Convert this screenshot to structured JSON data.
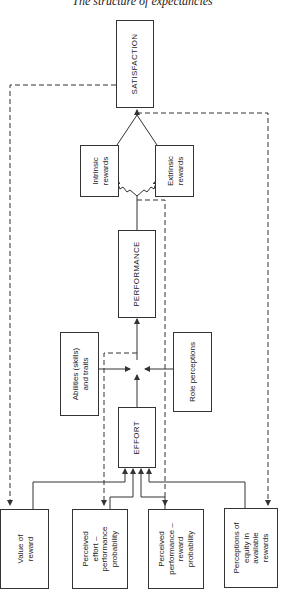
{
  "title": "The structure of expectancies",
  "nodes": {
    "satisfaction": "SATISFACTION",
    "intrinsic_rewards": "Intrinsic\nrewards",
    "extrinsic_rewards": "Extrinsic\nrewards",
    "performance": "PERFORMANCE",
    "abilities": "Abilities (skills)\nand traits",
    "role_perceptions": "Role perceptions",
    "effort": "EFFORT",
    "value_of_reward": "Value of\nreward",
    "perceived_effort_performance": "Perceived\neffort –\nperformance\nprobability",
    "perceived_performance_reward": "Perceived\nperformance –\nreward\nprobability",
    "perceptions_of_equity": "Perceptions of\nequity in\navailable\nrewards"
  },
  "colors": {
    "line": "#333333",
    "background": "#ffffff"
  }
}
